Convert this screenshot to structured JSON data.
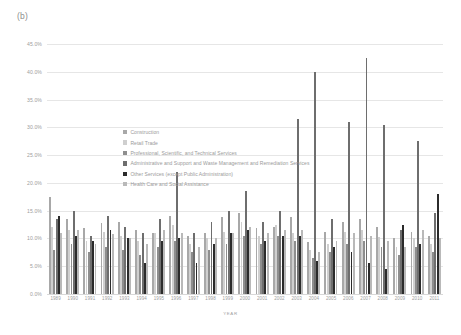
{
  "panel_label": "(b)",
  "legend": {
    "items": [
      {
        "label": "Construction",
        "color": "#a8a8a8"
      },
      {
        "label": "Retail Trade",
        "color": "#cfcfcf"
      },
      {
        "label": "Professional, Scientific, and Technical Services",
        "color": "#8e8e8e"
      },
      {
        "label": "Administrative and Support and Waste Management and Remediation Services",
        "color": "#6e6e6e"
      },
      {
        "label": "Other Services (except Public Administration)",
        "color": "#2b2b2b"
      },
      {
        "label": "Health Care and Social Assistance",
        "color": "#b9b9b9"
      }
    ]
  },
  "chart_data": {
    "type": "bar",
    "title": "",
    "xlabel": "YEAR",
    "ylabel": "PERCENTAGE",
    "ylim": [
      0,
      45
    ],
    "ytick_labels": [
      "0.0%",
      "5.0%",
      "10.0%",
      "15.0%",
      "20.0%",
      "25.0%",
      "30.0%",
      "35.0%",
      "40.0%",
      "45.0%"
    ],
    "ytick_values": [
      0,
      5,
      10,
      15,
      20,
      25,
      30,
      35,
      40,
      45
    ],
    "grid": true,
    "legend_position": "inside-upper-left",
    "categories": [
      "1989",
      "1990",
      "1991",
      "1992",
      "1993",
      "1994",
      "1995",
      "1996",
      "1997",
      "1998",
      "1999",
      "2000",
      "2001",
      "2002",
      "2003",
      "2004",
      "2005",
      "2006",
      "2007",
      "2008",
      "2009",
      "2010",
      "2011"
    ],
    "series": [
      {
        "name": "Construction",
        "color": "#a8a8a8",
        "values": [
          17.5,
          13.5,
          11.8,
          12.8,
          13.0,
          11.5,
          11.0,
          14.0,
          10.5,
          11.0,
          13.8,
          14.5,
          11.8,
          12.0,
          13.8,
          9.3,
          11.2,
          13.0,
          13.5,
          12.0,
          10.0,
          11.2,
          10.5
        ]
      },
      {
        "name": "Retail Trade",
        "color": "#cfcfcf",
        "values": [
          12.0,
          11.5,
          9.5,
          11.2,
          10.5,
          9.5,
          11.0,
          12.5,
          9.0,
          10.0,
          11.2,
          13.0,
          10.5,
          12.5,
          11.0,
          8.0,
          9.0,
          11.2,
          11.5,
          10.2,
          8.5,
          10.0,
          9.0
        ]
      },
      {
        "name": "Professional, Scientific, and Technical Services",
        "color": "#8e8e8e",
        "values": [
          8.0,
          9.0,
          7.5,
          8.5,
          8.0,
          7.0,
          8.5,
          9.5,
          7.5,
          8.0,
          9.0,
          10.5,
          9.0,
          10.5,
          9.5,
          6.5,
          7.5,
          9.0,
          9.5,
          8.5,
          7.0,
          8.5,
          7.5
        ]
      },
      {
        "name": "Administrative and Support and Waste Management and Remediation Services",
        "color": "#6e6e6e",
        "values": [
          13.5,
          15.0,
          10.5,
          14.0,
          12.0,
          11.0,
          13.5,
          22.0,
          11.0,
          13.0,
          15.0,
          18.5,
          13.0,
          15.0,
          31.5,
          40.0,
          13.5,
          31.0,
          42.5,
          30.5,
          11.5,
          27.5,
          14.5
        ]
      },
      {
        "name": "Other Services (except Public Administration)",
        "color": "#2b2b2b",
        "values": [
          14.0,
          10.5,
          9.5,
          11.5,
          10.0,
          5.5,
          9.5,
          10.0,
          5.5,
          9.0,
          11.0,
          11.5,
          9.5,
          10.5,
          10.5,
          6.0,
          8.5,
          7.5,
          5.5,
          4.5,
          12.5,
          9.0,
          18.0
        ]
      },
      {
        "name": "Health Care and Social Assistance",
        "color": "#b9b9b9",
        "values": [
          11.0,
          11.5,
          9.0,
          10.8,
          10.0,
          9.0,
          11.5,
          11.0,
          8.5,
          10.0,
          11.0,
          12.0,
          11.0,
          11.5,
          11.5,
          7.5,
          9.5,
          11.0,
          10.5,
          9.5,
          8.5,
          11.5,
          10.0
        ]
      }
    ]
  }
}
